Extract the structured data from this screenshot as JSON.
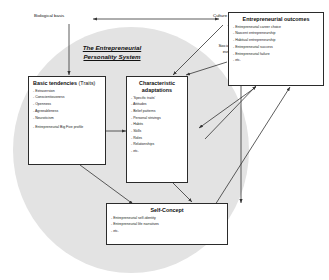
{
  "diagram": {
    "system_title_line1": "The Entrepreneurial",
    "system_title_line2": "Personality System",
    "ellipse_fill": "#e3e3e3",
    "line_color": "#333333",
    "box_border_color": "#2b2b2b"
  },
  "labels": {
    "biological_basis": "Biological basis",
    "culture": "Culture",
    "social_ecology_line1": "Social ecology of",
    "social_ecology_line2": "everyday life"
  },
  "boxes": {
    "basic_tendencies": {
      "title_bold": "Basic tendencies",
      "title_regular": " (Traits)",
      "items": [
        "Extraversion",
        "Conscientiousness",
        "Openness",
        "Agreeableness",
        "Neuroticism",
        "Entrepreneurial Big Five profile"
      ]
    },
    "characteristic_adaptations": {
      "title_line1": "Characteristic",
      "title_line2": "adaptations",
      "items": [
        "'Specific traits'",
        "Attitudes",
        "Belief patterns",
        "Personal strivings",
        "Habits",
        "Skills",
        "Roles",
        "Relationships",
        "etc."
      ]
    },
    "self_concept": {
      "title": "Self-Concept",
      "items": [
        "Entrepreneurial self-identity",
        "Entrepreneurial life narratives",
        "etc."
      ]
    },
    "entrepreneurial_outcomes": {
      "title": "Entrepreneurial outcomes",
      "items": [
        "Entrepreneurial career choice",
        "Nascent entrepreneurship",
        "Habitual entrepreneurship",
        "Entrepreneurial success",
        "Entrepreneurial failure",
        "etc."
      ]
    }
  }
}
